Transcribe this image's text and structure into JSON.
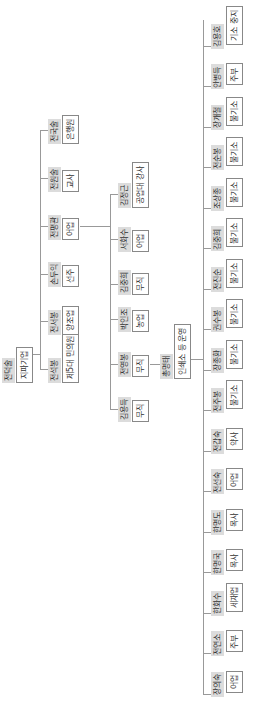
{
  "root": {
    "name": "전덕술",
    "role": "지파기업"
  },
  "level1": [
    {
      "name": "전석봉",
      "role": "제5대 민의원"
    },
    {
      "name": "전서봉",
      "role": "양조업"
    },
    {
      "name": "손두익",
      "role": "선주"
    },
    {
      "name": "전평관",
      "role": "어업"
    },
    {
      "name": "전원술",
      "role": "교사"
    },
    {
      "name": "전국술",
      "role": "은행원"
    }
  ],
  "level2": [
    {
      "name": "김용득",
      "role": "무직"
    },
    {
      "name": "전영봉",
      "role": "무직"
    },
    {
      "name": "박인조",
      "role": "농업"
    },
    {
      "name": "김중희",
      "role": "무직"
    },
    {
      "name": "서화수",
      "role": "어업"
    },
    {
      "name": "김정근",
      "role": "공업대 강사"
    }
  ],
  "level2b": {
    "name": "총명태",
    "role": "인쇄소 등 운영"
  },
  "level3": [
    {
      "name": "장의숙",
      "role": "어업"
    },
    {
      "name": "전연소",
      "role": "주부"
    },
    {
      "name": "한화수",
      "role": "세재업"
    },
    {
      "name": "한명국",
      "role": "목사"
    },
    {
      "name": "한명도",
      "role": "목사"
    },
    {
      "name": "전선숙",
      "role": "어업"
    },
    {
      "name": "전갑숙",
      "role": "약사"
    },
    {
      "name": "전주봉",
      "role": "불기소"
    },
    {
      "name": "장종환",
      "role": "불기소"
    },
    {
      "name": "권수봉",
      "role": "불기소"
    },
    {
      "name": "전진순",
      "role": "불기소"
    },
    {
      "name": "김중희",
      "role": "불기소"
    },
    {
      "name": "조상종",
      "role": "불기소"
    },
    {
      "name": "전순봉",
      "role": "불기소"
    },
    {
      "name": "장개철",
      "role": "불기소"
    },
    {
      "name": "안병득",
      "role": "주부"
    },
    {
      "name": "김용호",
      "role": "기소 중지"
    }
  ]
}
